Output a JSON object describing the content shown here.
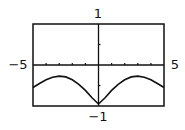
{
  "chart_data": {
    "type": "line",
    "title": "",
    "xlabel": "",
    "ylabel": "",
    "xlim": [
      -5,
      5
    ],
    "ylim": [
      -1,
      1
    ],
    "grid": false,
    "x_tick_step": 1,
    "y_tick_step": 0.5,
    "labels": {
      "x_min": "−5",
      "x_max": "5",
      "y_max": "1",
      "y_min": "−1"
    },
    "series": [
      {
        "name": "f(x)",
        "x": [
          -5,
          -4.5,
          -4,
          -3.5,
          -3,
          -2.5,
          -2,
          -1.5,
          -1,
          -0.5,
          0,
          0.5,
          1,
          1.5,
          2,
          2.5,
          3,
          3.5,
          4,
          4.5,
          5
        ],
        "values": [
          -0.55,
          -0.45,
          -0.36,
          -0.3,
          -0.27,
          -0.29,
          -0.36,
          -0.47,
          -0.62,
          -0.8,
          -0.95,
          -0.8,
          -0.62,
          -0.47,
          -0.36,
          -0.29,
          -0.27,
          -0.3,
          -0.36,
          -0.45,
          -0.55
        ]
      }
    ],
    "colors": {
      "axis": "#111111",
      "curve": "#111111",
      "frame": "#111111",
      "background": "#ffffff"
    }
  }
}
